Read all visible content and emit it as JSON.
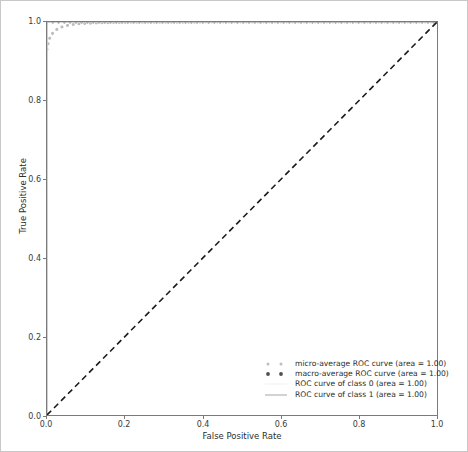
{
  "chart_data": {
    "type": "line",
    "title": "",
    "xlabel": "False Positive Rate",
    "ylabel": "True Positive Rate",
    "xlim": [
      0.0,
      1.0
    ],
    "ylim": [
      0.0,
      1.0
    ],
    "xticks": [
      "0.0",
      "0.2",
      "0.4",
      "0.6",
      "0.8",
      "1.0"
    ],
    "yticks": [
      "0.0",
      "0.2",
      "0.4",
      "0.6",
      "0.8",
      "1.0"
    ],
    "xtick_values": [
      0.0,
      0.2,
      0.4,
      0.6,
      0.8,
      1.0
    ],
    "ytick_values": [
      0.0,
      0.2,
      0.4,
      0.6,
      0.8,
      1.0
    ],
    "grid": false,
    "legend_position": "lower right",
    "series": [
      {
        "name": "micro-average ROC curve (area = 1.00)",
        "style": "dotted",
        "color": "#bdbdbd",
        "linewidth": 3,
        "x": [
          0.0,
          0.002,
          0.005,
          0.008,
          0.012,
          0.018,
          0.025,
          0.032,
          0.04,
          0.05,
          0.062,
          0.075,
          0.09,
          0.11,
          0.14,
          0.2,
          0.3,
          0.45,
          0.6,
          0.8,
          1.0
        ],
        "y": [
          0.93,
          0.942,
          0.953,
          0.962,
          0.969,
          0.975,
          0.981,
          0.985,
          0.988,
          0.991,
          0.993,
          0.995,
          0.996,
          0.997,
          0.998,
          0.999,
          0.9995,
          0.9998,
          1.0,
          1.0,
          1.0
        ]
      },
      {
        "name": "macro-average ROC curve (area = 1.00)",
        "style": "dotted",
        "color": "#5a5a5a",
        "linewidth": 3,
        "x": [
          0.0,
          0.05,
          0.1,
          0.2,
          0.3,
          0.4,
          0.5,
          0.6,
          0.7,
          0.8,
          0.9,
          1.0
        ],
        "y": [
          1.0,
          1.0,
          1.0,
          1.0,
          1.0,
          1.0,
          1.0,
          1.0,
          1.0,
          1.0,
          1.0,
          1.0
        ]
      },
      {
        "name": "ROC curve of class 0 (area = 1.00)",
        "style": "solid",
        "color": "#f2f2f2",
        "linewidth": 1.2,
        "x": [
          0.0,
          0.0,
          1.0
        ],
        "y": [
          0.0,
          1.0,
          1.0
        ]
      },
      {
        "name": "ROC curve of class 1 (area = 1.00)",
        "style": "solid",
        "color": "#b5b5b5",
        "linewidth": 1.2,
        "x": [
          0.0,
          0.0,
          1.0
        ],
        "y": [
          0.0,
          1.0,
          1.0
        ]
      },
      {
        "name": "chance-line",
        "style": "dashed",
        "color": "#1a1a1a",
        "linewidth": 1.6,
        "x": [
          0.0,
          1.0
        ],
        "y": [
          0.0,
          1.0
        ],
        "in_legend": false
      }
    ]
  },
  "legend": {
    "entries": [
      {
        "label": "micro-average ROC curve (area = 1.00)",
        "marker": "dotted-light"
      },
      {
        "label": "macro-average ROC curve (area = 1.00)",
        "marker": "dotted-dark"
      },
      {
        "label": "ROC curve of class 0 (area = 1.00)",
        "marker": "line-faint"
      },
      {
        "label": "ROC curve of class 1 (area = 1.00)",
        "marker": "line-gray"
      }
    ]
  }
}
